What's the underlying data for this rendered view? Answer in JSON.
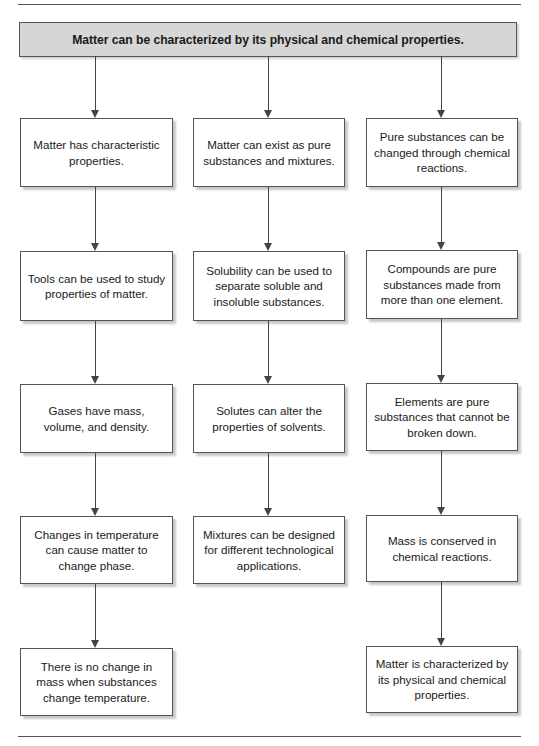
{
  "diagram": {
    "type": "flowchart",
    "header": "Matter can be characterized by its physical and chemical properties.",
    "columns": [
      {
        "nodes": [
          "Matter has characteristic properties.",
          "Tools can be used to study properties of matter.",
          "Gases have mass, volume, and density.",
          "Changes in temperature can cause matter to change phase.",
          "There is no change in mass when substances change temperature."
        ]
      },
      {
        "nodes": [
          "Matter can exist as pure substances and mixtures.",
          "Solubility can be used to separate soluble and insoluble substances.",
          "Solutes can alter the properties of solvents.",
          "Mixtures can be designed for different technological applications."
        ]
      },
      {
        "nodes": [
          "Pure substances can be changed through chemical reactions.",
          "Compounds are pure substances made from more than one element.",
          "Elements are pure substances that cannot be broken down.",
          "Mass is conserved in chemical reactions.",
          "Matter is characterized by its physical and chemical properties."
        ]
      }
    ],
    "colors": {
      "header_fill": "#d6d6d6",
      "box_fill": "#ffffff",
      "border": "#555555",
      "arrow": "#444444"
    }
  }
}
